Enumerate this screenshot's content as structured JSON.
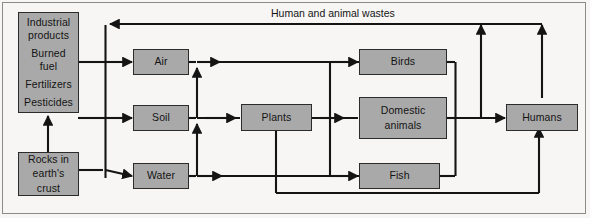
{
  "figure": {
    "type": "flow-diagram",
    "background_color": "#f7f6f4",
    "node_fill_color": "#a9a9a9",
    "node_border_color": "#2b2b2b",
    "line_color": "#141414"
  },
  "nodes": {
    "sources": {
      "name": "industrial-sources",
      "lines": [
        "Industrial",
        "products",
        "Burned",
        "fuel",
        "Fertilizers",
        "Pesticides"
      ],
      "groups": [
        [
          "Industrial",
          "products"
        ],
        [
          "Burned",
          "fuel"
        ],
        [
          "Fertilizers"
        ],
        [
          "Pesticides"
        ]
      ]
    },
    "rocks": {
      "name": "rocks-in-earths-crust",
      "lines": [
        "Rocks in",
        "earth's",
        "crust"
      ]
    },
    "air": {
      "name": "air",
      "label": "Air"
    },
    "soil": {
      "name": "soil",
      "label": "Soil"
    },
    "water": {
      "name": "water",
      "label": "Water"
    },
    "plants": {
      "name": "plants",
      "label": "Plants"
    },
    "birds": {
      "name": "birds",
      "label": "Birds"
    },
    "domestic_animals": {
      "name": "domestic-animals",
      "lines": [
        "Domestic",
        "animals"
      ]
    },
    "fish": {
      "name": "fish",
      "label": "Fish"
    },
    "humans": {
      "name": "humans",
      "label": "Humans"
    }
  },
  "edge_labels": {
    "wastes": "Human and animal wastes"
  },
  "flows": [
    {
      "from": "Industrial products / Burned fuel / Fertilizers / Pesticides",
      "to": "Air"
    },
    {
      "from": "Industrial products / Burned fuel / Fertilizers / Pesticides",
      "to": "Soil"
    },
    {
      "from": "Industrial products / Burned fuel / Fertilizers / Pesticides",
      "to": "Water"
    },
    {
      "from": "Rocks in earth's crust",
      "to": "Industrial products / Burned fuel / Fertilizers / Pesticides"
    },
    {
      "from": "Rocks in earth's crust",
      "to": "Water"
    },
    {
      "from": "Water",
      "to": "Soil"
    },
    {
      "from": "Soil",
      "to": "Air"
    },
    {
      "from": "Soil",
      "to": "Plants"
    },
    {
      "from": "Air",
      "to": "Birds"
    },
    {
      "from": "Plants",
      "to": "Domestic animals"
    },
    {
      "from": "Water",
      "to": "Fish"
    },
    {
      "from": "Plants",
      "to": "Humans"
    },
    {
      "from": "Birds",
      "to": "Humans"
    },
    {
      "from": "Domestic animals",
      "to": "Humans"
    },
    {
      "from": "Fish",
      "to": "Humans"
    },
    {
      "from": "Birds / Domestic animals / Fish",
      "to": "Air / Soil / Water",
      "label": "Human and animal wastes"
    },
    {
      "from": "Humans",
      "to": "Air / Soil / Water",
      "label": "Human and animal wastes"
    }
  ]
}
